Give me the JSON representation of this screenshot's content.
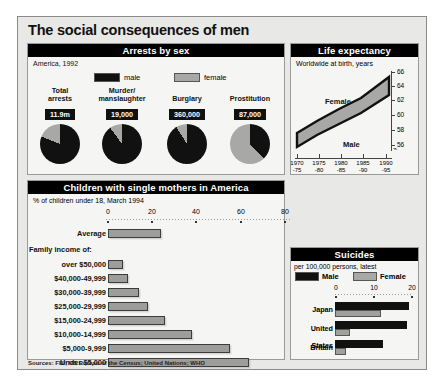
{
  "title": "The social consequences of men",
  "sources": "Sources: FBI; US Bureau of the Census; United Nations; WHO",
  "arrests": {
    "header": "Arrests by sex",
    "subtitle": "America, 1992",
    "legend": {
      "male": "male",
      "female": "female"
    },
    "items": [
      {
        "label_line1": "Total",
        "label_line2": "arrests",
        "value": "11.9m",
        "male_pct": 81,
        "female_pct": 19
      },
      {
        "label_line1": "Murder/",
        "label_line2": "manslaughter",
        "value": "19,000",
        "male_pct": 90,
        "female_pct": 10
      },
      {
        "label_line1": "Burglary",
        "label_line2": "",
        "value": "360,000",
        "male_pct": 91,
        "female_pct": 9
      },
      {
        "label_line1": "Prostitution",
        "label_line2": "",
        "value": "87,000",
        "male_pct": 38,
        "female_pct": 62
      }
    ]
  },
  "life": {
    "header": "Life expectancy",
    "subtitle": "Worldwide at birth, years",
    "female_label": "Female",
    "male_label": "Male",
    "axis_break": "⌁",
    "yticks": [
      "66",
      "64",
      "62",
      "60",
      "58",
      "56"
    ],
    "xticks": [
      {
        "l1": "1970",
        "l2": "-75"
      },
      {
        "l1": "1975",
        "l2": "-80"
      },
      {
        "l1": "1980",
        "l2": "-85"
      },
      {
        "l1": "1985",
        "l2": "-90"
      },
      {
        "l1": "1990",
        "l2": "-95"
      }
    ]
  },
  "mothers": {
    "header": "Children with single mothers in America",
    "subtitle": "% of children under 18, March 1994",
    "xticks": [
      "0",
      "20",
      "40",
      "60",
      "80"
    ],
    "group_label": "Family income of:",
    "average": {
      "label": "Average",
      "value": 24
    },
    "rows": [
      {
        "label": "over $50,000",
        "value": 7
      },
      {
        "label": "$40,000-49,999",
        "value": 9
      },
      {
        "label": "$30,000-39,999",
        "value": 14
      },
      {
        "label": "$25,000-29,999",
        "value": 18
      },
      {
        "label": "$15,000-24,999",
        "value": 26
      },
      {
        "label": "$10,000-14,999",
        "value": 38
      },
      {
        "label": "$5,000-9,999",
        "value": 55
      },
      {
        "label": "Under $5,000",
        "value": 64
      }
    ]
  },
  "suicides": {
    "header": "Suicides",
    "subtitle": "per 100,000 persons, latest",
    "legend": {
      "male": "Male",
      "female": "Female"
    },
    "xticks": [
      "0",
      "10",
      "20"
    ],
    "rows": [
      {
        "label": "Japan",
        "male": 19.5,
        "female": 12.0
      },
      {
        "label": "United States",
        "male": 19.0,
        "female": 4.0
      },
      {
        "label": "Britain",
        "male": 12.5,
        "female": 3.0
      }
    ]
  },
  "chart_data": [
    {
      "type": "pie",
      "title": "Arrests by sex",
      "subtitle": "America, 1992",
      "legend": [
        "male",
        "female"
      ],
      "charts": [
        {
          "name": "Total arrests",
          "total": "11.9m",
          "slices": [
            {
              "label": "male",
              "value": 81
            },
            {
              "label": "female",
              "value": 19
            }
          ]
        },
        {
          "name": "Murder/manslaughter",
          "total": "19,000",
          "slices": [
            {
              "label": "male",
              "value": 90
            },
            {
              "label": "female",
              "value": 10
            }
          ]
        },
        {
          "name": "Burglary",
          "total": "360,000",
          "slices": [
            {
              "label": "male",
              "value": 91
            },
            {
              "label": "female",
              "value": 9
            }
          ]
        },
        {
          "name": "Prostitution",
          "total": "87,000",
          "slices": [
            {
              "label": "male",
              "value": 38
            },
            {
              "label": "female",
              "value": 62
            }
          ]
        }
      ]
    },
    {
      "type": "area",
      "title": "Life expectancy",
      "subtitle": "Worldwide at birth, years",
      "xlabel": "",
      "ylabel": "years",
      "ylim": [
        55,
        67
      ],
      "grid": false,
      "x": [
        "1970-75",
        "1975-80",
        "1980-85",
        "1985-90",
        "1990-95"
      ],
      "series": [
        {
          "name": "Female",
          "values": [
            57.6,
            59.5,
            61.4,
            63.2,
            65.9
          ]
        },
        {
          "name": "Male",
          "values": [
            54.5,
            56.2,
            57.9,
            59.6,
            61.9
          ]
        }
      ]
    },
    {
      "type": "bar",
      "title": "Children with single mothers in America",
      "subtitle": "% of children under 18, March 1994",
      "orientation": "horizontal",
      "xlabel": "%",
      "ylabel": "",
      "xlim": [
        0,
        80
      ],
      "grid": false,
      "categories": [
        "Average",
        "over $50,000",
        "$40,000-49,999",
        "$30,000-39,999",
        "$25,000-29,999",
        "$15,000-24,999",
        "$10,000-14,999",
        "$5,000-9,999",
        "Under $5,000"
      ],
      "values": [
        24,
        7,
        9,
        14,
        18,
        26,
        38,
        55,
        64
      ]
    },
    {
      "type": "bar",
      "title": "Suicides",
      "subtitle": "per 100,000 persons, latest",
      "orientation": "horizontal",
      "xlim": [
        0,
        20
      ],
      "grid": false,
      "categories": [
        "Japan",
        "United States",
        "Britain"
      ],
      "series": [
        {
          "name": "Male",
          "values": [
            19.5,
            19.0,
            12.5
          ]
        },
        {
          "name": "Female",
          "values": [
            12.0,
            4.0,
            3.0
          ]
        }
      ]
    }
  ]
}
